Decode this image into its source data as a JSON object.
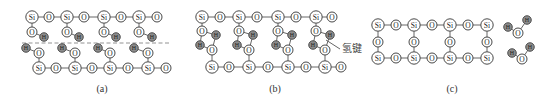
{
  "figure": {
    "panels": [
      {
        "id": "a",
        "caption": "(a)",
        "caption_pos": [
          102,
          92
        ],
        "dashed_line": {
          "x1": 22,
          "y1": 43,
          "x2": 170,
          "y2": 43
        },
        "atoms": [
          {
            "el": "Si",
            "x": 32,
            "y": 17
          },
          {
            "el": "O",
            "x": 49,
            "y": 17
          },
          {
            "el": "Si",
            "x": 67,
            "y": 17
          },
          {
            "el": "O",
            "x": 84,
            "y": 17
          },
          {
            "el": "Si",
            "x": 104,
            "y": 17
          },
          {
            "el": "O",
            "x": 121,
            "y": 17
          },
          {
            "el": "Si",
            "x": 139,
            "y": 17
          },
          {
            "el": "O",
            "x": 157,
            "y": 17
          },
          {
            "el": "O",
            "x": 32,
            "y": 32
          },
          {
            "el": "H",
            "x": 44,
            "y": 37
          },
          {
            "el": "O",
            "x": 67,
            "y": 32
          },
          {
            "el": "H",
            "x": 79,
            "y": 37
          },
          {
            "el": "O",
            "x": 104,
            "y": 32
          },
          {
            "el": "H",
            "x": 116,
            "y": 37
          },
          {
            "el": "O",
            "x": 139,
            "y": 32
          },
          {
            "el": "H",
            "x": 152,
            "y": 37
          },
          {
            "el": "H",
            "x": 26,
            "y": 48
          },
          {
            "el": "O",
            "x": 39,
            "y": 53
          },
          {
            "el": "H",
            "x": 62,
            "y": 48
          },
          {
            "el": "O",
            "x": 75,
            "y": 53
          },
          {
            "el": "H",
            "x": 98,
            "y": 48
          },
          {
            "el": "O",
            "x": 110,
            "y": 53
          },
          {
            "el": "H",
            "x": 134,
            "y": 48
          },
          {
            "el": "O",
            "x": 148,
            "y": 53
          },
          {
            "el": "Si",
            "x": 39,
            "y": 68
          },
          {
            "el": "O",
            "x": 56,
            "y": 68
          },
          {
            "el": "Si",
            "x": 75,
            "y": 68
          },
          {
            "el": "O",
            "x": 92,
            "y": 68
          },
          {
            "el": "Si",
            "x": 110,
            "y": 68
          },
          {
            "el": "O",
            "x": 128,
            "y": 68
          },
          {
            "el": "Si",
            "x": 148,
            "y": 68
          },
          {
            "el": "O",
            "x": 166,
            "y": 68
          }
        ],
        "bonds": [
          [
            0,
            1
          ],
          [
            1,
            2
          ],
          [
            2,
            3
          ],
          [
            3,
            4
          ],
          [
            4,
            5
          ],
          [
            5,
            6
          ],
          [
            6,
            7
          ],
          [
            0,
            8
          ],
          [
            8,
            9
          ],
          [
            2,
            10
          ],
          [
            10,
            11
          ],
          [
            4,
            12
          ],
          [
            12,
            13
          ],
          [
            6,
            14
          ],
          [
            14,
            15
          ],
          [
            16,
            17
          ],
          [
            18,
            19
          ],
          [
            20,
            21
          ],
          [
            22,
            23
          ],
          [
            17,
            24
          ],
          [
            19,
            26
          ],
          [
            21,
            28
          ],
          [
            23,
            30
          ],
          [
            24,
            25
          ],
          [
            25,
            26
          ],
          [
            26,
            27
          ],
          [
            27,
            28
          ],
          [
            28,
            29
          ],
          [
            29,
            30
          ],
          [
            30,
            31
          ]
        ]
      },
      {
        "id": "b",
        "caption": "(b)",
        "caption_pos": [
          275,
          92
        ],
        "hbond_label": "氢键",
        "hbond_label_pos": [
          342,
          52
        ],
        "leader_line": {
          "x1": 326,
          "y1": 40,
          "x2": 340,
          "y2": 49
        },
        "atoms": [
          {
            "el": "Si",
            "x": 202,
            "y": 17
          },
          {
            "el": "O",
            "x": 220,
            "y": 17
          },
          {
            "el": "Si",
            "x": 239,
            "y": 17
          },
          {
            "el": "O",
            "x": 257,
            "y": 17
          },
          {
            "el": "Si",
            "x": 278,
            "y": 17
          },
          {
            "el": "O",
            "x": 296,
            "y": 17
          },
          {
            "el": "Si",
            "x": 316,
            "y": 17
          },
          {
            "el": "O",
            "x": 332,
            "y": 17
          },
          {
            "el": "O",
            "x": 202,
            "y": 31
          },
          {
            "el": "H",
            "x": 216,
            "y": 35
          },
          {
            "el": "H",
            "x": 200,
            "y": 45
          },
          {
            "el": "O",
            "x": 212,
            "y": 50
          },
          {
            "el": "O",
            "x": 239,
            "y": 31
          },
          {
            "el": "H",
            "x": 253,
            "y": 35
          },
          {
            "el": "H",
            "x": 237,
            "y": 45
          },
          {
            "el": "O",
            "x": 249,
            "y": 50
          },
          {
            "el": "O",
            "x": 278,
            "y": 31
          },
          {
            "el": "H",
            "x": 292,
            "y": 35
          },
          {
            "el": "H",
            "x": 276,
            "y": 45
          },
          {
            "el": "O",
            "x": 288,
            "y": 50
          },
          {
            "el": "O",
            "x": 316,
            "y": 31
          },
          {
            "el": "H",
            "x": 330,
            "y": 35
          },
          {
            "el": "H",
            "x": 313,
            "y": 45
          },
          {
            "el": "O",
            "x": 325,
            "y": 50
          },
          {
            "el": "Si",
            "x": 212,
            "y": 67
          },
          {
            "el": "O",
            "x": 229,
            "y": 67
          },
          {
            "el": "Si",
            "x": 249,
            "y": 67
          },
          {
            "el": "O",
            "x": 268,
            "y": 67
          },
          {
            "el": "Si",
            "x": 288,
            "y": 67
          },
          {
            "el": "O",
            "x": 306,
            "y": 67
          },
          {
            "el": "Si",
            "x": 325,
            "y": 67
          },
          {
            "el": "O",
            "x": 341,
            "y": 67
          }
        ],
        "bonds": [
          [
            0,
            1
          ],
          [
            1,
            2
          ],
          [
            2,
            3
          ],
          [
            3,
            4
          ],
          [
            4,
            5
          ],
          [
            5,
            6
          ],
          [
            6,
            7
          ],
          [
            0,
            8
          ],
          [
            8,
            9
          ],
          [
            10,
            11
          ],
          [
            2,
            12
          ],
          [
            12,
            13
          ],
          [
            14,
            15
          ],
          [
            4,
            16
          ],
          [
            16,
            17
          ],
          [
            18,
            19
          ],
          [
            6,
            20
          ],
          [
            20,
            21
          ],
          [
            22,
            23
          ],
          [
            11,
            24
          ],
          [
            15,
            26
          ],
          [
            19,
            28
          ],
          [
            23,
            30
          ],
          [
            24,
            25
          ],
          [
            25,
            26
          ],
          [
            26,
            27
          ],
          [
            27,
            28
          ],
          [
            28,
            29
          ],
          [
            29,
            30
          ],
          [
            30,
            31
          ]
        ],
        "hbonds": [
          [
            9,
            11
          ],
          [
            8,
            10
          ],
          [
            13,
            15
          ],
          [
            12,
            14
          ],
          [
            17,
            19
          ],
          [
            16,
            18
          ],
          [
            21,
            23
          ],
          [
            20,
            22
          ]
        ]
      },
      {
        "id": "c",
        "caption": "(c)",
        "caption_pos": [
          452,
          92
        ],
        "atoms": [
          {
            "el": "Si",
            "x": 378,
            "y": 25
          },
          {
            "el": "O",
            "x": 396,
            "y": 25
          },
          {
            "el": "Si",
            "x": 414,
            "y": 25
          },
          {
            "el": "O",
            "x": 432,
            "y": 25
          },
          {
            "el": "Si",
            "x": 450,
            "y": 25
          },
          {
            "el": "O",
            "x": 468,
            "y": 25
          },
          {
            "el": "Si",
            "x": 487,
            "y": 25
          },
          {
            "el": "O",
            "x": 378,
            "y": 42
          },
          {
            "el": "O",
            "x": 414,
            "y": 42
          },
          {
            "el": "O",
            "x": 450,
            "y": 42
          },
          {
            "el": "O",
            "x": 487,
            "y": 42
          },
          {
            "el": "Si",
            "x": 378,
            "y": 58
          },
          {
            "el": "O",
            "x": 396,
            "y": 58
          },
          {
            "el": "Si",
            "x": 414,
            "y": 58
          },
          {
            "el": "O",
            "x": 432,
            "y": 58
          },
          {
            "el": "Si",
            "x": 450,
            "y": 58
          },
          {
            "el": "O",
            "x": 468,
            "y": 58
          },
          {
            "el": "Si",
            "x": 487,
            "y": 58
          },
          {
            "el": "H",
            "x": 508,
            "y": 27
          },
          {
            "el": "O",
            "x": 518,
            "y": 33
          },
          {
            "el": "H",
            "x": 527,
            "y": 20
          },
          {
            "el": "H",
            "x": 512,
            "y": 53
          },
          {
            "el": "O",
            "x": 522,
            "y": 59
          },
          {
            "el": "H",
            "x": 530,
            "y": 47
          }
        ],
        "bonds": [
          [
            0,
            1
          ],
          [
            1,
            2
          ],
          [
            2,
            3
          ],
          [
            3,
            4
          ],
          [
            4,
            5
          ],
          [
            5,
            6
          ],
          [
            0,
            7
          ],
          [
            7,
            11
          ],
          [
            2,
            8
          ],
          [
            8,
            13
          ],
          [
            4,
            9
          ],
          [
            9,
            15
          ],
          [
            6,
            10
          ],
          [
            10,
            17
          ],
          [
            11,
            12
          ],
          [
            12,
            13
          ],
          [
            13,
            14
          ],
          [
            14,
            15
          ],
          [
            15,
            16
          ],
          [
            16,
            17
          ],
          [
            18,
            19
          ],
          [
            19,
            20
          ],
          [
            21,
            22
          ],
          [
            22,
            23
          ]
        ]
      }
    ]
  }
}
